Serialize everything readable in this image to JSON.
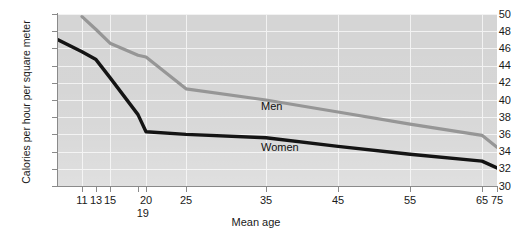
{
  "chart_data": {
    "type": "line",
    "title": "",
    "xlabel": "Mean age",
    "ylabel": "Calories per hour per square meter",
    "ylim": [
      30,
      50
    ],
    "y_ticks": [
      50,
      48,
      46,
      44,
      42,
      40,
      38,
      36,
      34,
      32,
      30
    ],
    "x_ticks": [
      11,
      13,
      15,
      19,
      20,
      25,
      35,
      45,
      55,
      65,
      75
    ],
    "x_tick_labels": [
      "11",
      "13",
      "15",
      "19",
      "20",
      "25",
      "35",
      "45",
      "55",
      "65",
      "75"
    ],
    "x_tick_below_label": "19",
    "grid": true,
    "grid_color": "#f2f2f2",
    "plot_background": "#d5d5d5",
    "legend_position": "inline-annotations",
    "series": [
      {
        "name": "Men",
        "color": "#969696",
        "x": [
          11,
          13,
          15,
          19,
          20,
          25,
          35,
          45,
          55,
          65,
          75
        ],
        "values": [
          49.7,
          48.2,
          46.6,
          45.2,
          45.0,
          41.3,
          40.0,
          38.6,
          37.2,
          35.9,
          34.5
        ]
      },
      {
        "name": "Women",
        "color": "#141414",
        "x": [
          9,
          11,
          13,
          15,
          19,
          20,
          25,
          35,
          45,
          55,
          65,
          75
        ],
        "values": [
          47.0,
          45.6,
          44.7,
          42.6,
          38.3,
          36.3,
          36.0,
          35.6,
          34.6,
          33.7,
          32.9,
          32.1
        ]
      }
    ],
    "annotations": [
      {
        "text": "Men",
        "x": 36,
        "y": 42.2
      },
      {
        "text": "Women",
        "x": 36,
        "y": 37.3
      }
    ]
  },
  "axes": {
    "y_title": "Calories per hour per square meter",
    "x_title": "Mean age",
    "y_tick_labels": [
      "50",
      "48",
      "46",
      "44",
      "42",
      "40",
      "38",
      "36",
      "34",
      "32",
      "30"
    ],
    "x_tick_labels": [
      "11",
      "13",
      "15",
      "20",
      "25",
      "35",
      "45",
      "55",
      "65",
      "75"
    ],
    "x_sub_tick_label": "19"
  },
  "series_labels": {
    "men": "Men",
    "women": "Women"
  },
  "colors": {
    "men_line": "#969696",
    "women_line": "#141414",
    "plot_bg": "#d5d5d5",
    "grid": "#f2f2f2",
    "axis": "#8a8a8a",
    "text": "#1a1a1a"
  }
}
